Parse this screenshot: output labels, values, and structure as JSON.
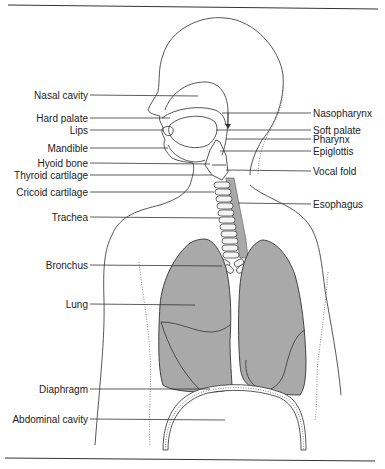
{
  "figure": {
    "colors": {
      "lung_fill": "#a9a9a9",
      "line": "#333333",
      "background": "#ffffff"
    }
  },
  "labels_left": [
    {
      "id": "nasal-cavity",
      "text": "Nasal cavity"
    },
    {
      "id": "hard-palate",
      "text": "Hard palate"
    },
    {
      "id": "lips",
      "text": "Lips"
    },
    {
      "id": "mandible",
      "text": "Mandible"
    },
    {
      "id": "hyoid-bone",
      "text": "Hyoid bone"
    },
    {
      "id": "thyroid-cartilage",
      "text": "Thyroid cartilage"
    },
    {
      "id": "cricoid-cartilage",
      "text": "Cricoid cartilage"
    },
    {
      "id": "trachea",
      "text": "Trachea"
    },
    {
      "id": "bronchus",
      "text": "Bronchus"
    },
    {
      "id": "lung",
      "text": "Lung"
    },
    {
      "id": "diaphragm",
      "text": "Diaphragm"
    },
    {
      "id": "abdominal-cavity",
      "text": "Abdominal cavity"
    }
  ],
  "labels_right": [
    {
      "id": "nasopharynx",
      "text": "Nasopharynx"
    },
    {
      "id": "soft-palate",
      "text": "Soft palate"
    },
    {
      "id": "pharynx",
      "text": "Pharynx"
    },
    {
      "id": "epiglottis",
      "text": "Epiglottis"
    },
    {
      "id": "vocal-fold",
      "text": "Vocal fold"
    },
    {
      "id": "esophagus",
      "text": "Esophagus"
    }
  ]
}
